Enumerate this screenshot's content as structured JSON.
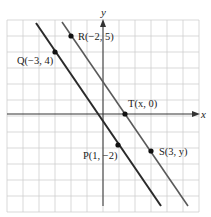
{
  "diagram": {
    "type": "coordinate-plane",
    "axes": {
      "x_label": "x",
      "y_label": "y",
      "x_range": [
        -6,
        6
      ],
      "y_range": [
        -5,
        6
      ]
    },
    "grid": {
      "on": true,
      "color": "#cfcfcf"
    },
    "points": [
      {
        "id": "Q",
        "label": "Q(−3, 4)",
        "x": -3,
        "y": 4
      },
      {
        "id": "R",
        "label": "R(−2, 5)",
        "x": -2,
        "y": 5
      },
      {
        "id": "T",
        "label": "T(x, 0)",
        "x": 1.5,
        "y": 0
      },
      {
        "id": "P",
        "label": "P(1, −2)",
        "x": 1,
        "y": -2
      },
      {
        "id": "S",
        "label": "S(3, y)",
        "x": 3,
        "y": -3
      }
    ],
    "lines": [
      {
        "name": "line-QP",
        "through": [
          "Q",
          "P"
        ],
        "color": "#2a2a2a"
      },
      {
        "name": "line-RS",
        "through": [
          "R",
          "T",
          "S"
        ],
        "color": "#555555"
      }
    ]
  }
}
